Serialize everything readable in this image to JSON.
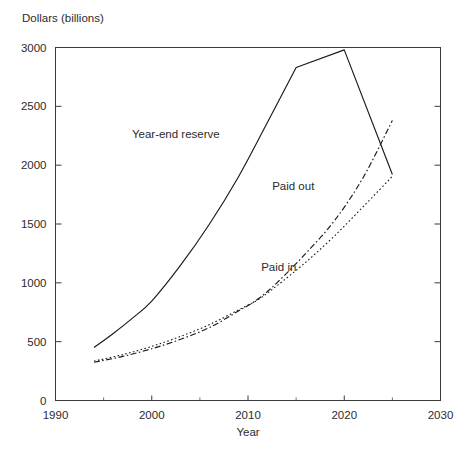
{
  "chart_data": {
    "type": "line",
    "title": "",
    "xlabel": "Year",
    "ylabel": "Dollars (billions)",
    "xlim": [
      1990,
      2030
    ],
    "ylim": [
      0,
      3000
    ],
    "grid": false,
    "legend_position": "inline-annotations",
    "x_ticks": [
      1990,
      2000,
      2010,
      2020,
      2030
    ],
    "x_tick_labels": [
      "1990",
      "2000",
      "2010",
      "2020",
      "2030"
    ],
    "x_minor_ticks": [
      1995,
      2005,
      2015,
      2025
    ],
    "y_ticks": [
      0,
      500,
      1000,
      1500,
      2000,
      2500,
      3000
    ],
    "y_tick_labels": [
      "0",
      "500",
      "1000",
      "1500",
      "2000",
      "2500",
      "3000"
    ],
    "series": [
      {
        "name": "Year-end reserve",
        "style": "solid",
        "label_x": 2002.5,
        "label_y": 2230,
        "x": [
          1994,
          1996,
          1998,
          2000,
          2003,
          2006,
          2009,
          2012,
          2015,
          2020,
          2025
        ],
        "values": [
          450,
          570,
          700,
          845,
          1150,
          1500,
          1900,
          2360,
          2830,
          2980,
          1920
        ]
      },
      {
        "name": "Paid out",
        "style": "dash-dot",
        "label_x": 2014.7,
        "label_y": 1790,
        "x": [
          1994,
          1997,
          2000,
          2003,
          2006,
          2009,
          2011,
          2013,
          2016,
          2019,
          2022,
          2025
        ],
        "values": [
          325,
          375,
          440,
          520,
          620,
          760,
          860,
          1000,
          1250,
          1530,
          1900,
          2380
        ]
      },
      {
        "name": "Paid in",
        "style": "dotted",
        "label_x": 2013.2,
        "label_y": 1100,
        "x": [
          1994,
          1997,
          2000,
          2003,
          2006,
          2009,
          2011,
          2013,
          2016,
          2019,
          2022,
          2025
        ],
        "values": [
          335,
          390,
          460,
          545,
          645,
          770,
          855,
          975,
          1175,
          1400,
          1650,
          1905
        ]
      }
    ],
    "colors": {
      "line": "#1a1a1a",
      "axis": "#3b3b3b",
      "text": "#2b2b2b",
      "background": "#ffffff"
    }
  }
}
